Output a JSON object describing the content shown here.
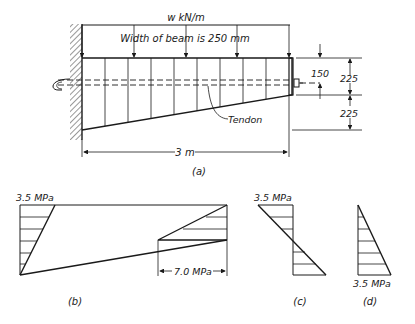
{
  "figure_a": {
    "load_label": "w kN/m",
    "width_note": "Width of beam is 250 mm",
    "tendon_label": "Tendon",
    "dim_150": "150",
    "dim_225_top": "225",
    "dim_225_bottom": "225",
    "span_label": "3 m",
    "caption": "(a)"
  },
  "figure_b": {
    "top_stress": "3.5 MPa",
    "bottom_stress": "7.0 MPa",
    "caption": "(b)"
  },
  "figure_c": {
    "stress": "3.5 MPa",
    "caption": "(c)"
  },
  "figure_d": {
    "stress": "3.5 MPa",
    "caption": "(d)"
  }
}
